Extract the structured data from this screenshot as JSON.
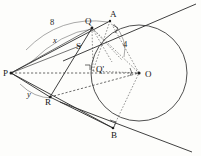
{
  "figure": {
    "background_color": "#fdfdfb",
    "ink_color": "#2b2b2b",
    "arc_color": "#6f6f6f"
  },
  "points": [
    {
      "id": "P",
      "label": "P",
      "x": 11,
      "y": 73,
      "label_x": 3,
      "label_y": 76,
      "dot": true
    },
    {
      "id": "Q",
      "label": "Q",
      "x": 92,
      "y": 28,
      "label_x": 85,
      "label_y": 24,
      "dot": true
    },
    {
      "id": "A",
      "label": "A",
      "x": 110,
      "y": 21,
      "label_x": 110,
      "label_y": 17,
      "dot": true
    },
    {
      "id": "S",
      "label": "S",
      "x": 82,
      "y": 45,
      "label_x": 76,
      "label_y": 49,
      "dot": false
    },
    {
      "id": "Qp",
      "label": "Q'",
      "x": 93,
      "y": 71,
      "label_x": 96,
      "label_y": 72,
      "dot": false
    },
    {
      "id": "O",
      "label": "O",
      "x": 139,
      "y": 73,
      "label_x": 145,
      "label_y": 77,
      "dot": true
    },
    {
      "id": "R",
      "label": "R",
      "x": 50,
      "y": 97,
      "label_x": 45,
      "label_y": 105,
      "dot": true
    },
    {
      "id": "B",
      "label": "B",
      "x": 113,
      "y": 128,
      "label_x": 111,
      "label_y": 138,
      "dot": true
    }
  ],
  "measure_labels": [
    {
      "id": "len-8",
      "text": "8",
      "x": 50,
      "y": 25,
      "style": "num"
    },
    {
      "id": "len-x",
      "text": "x",
      "x": 53,
      "y": 43,
      "style": "len"
    },
    {
      "id": "len-4",
      "text": "4",
      "x": 123,
      "y": 47,
      "style": "num"
    },
    {
      "id": "len-y",
      "text": "y",
      "x": 27,
      "y": 97,
      "style": "len"
    }
  ],
  "circle": {
    "center_x": 139,
    "center_y": 73,
    "radius": 48
  },
  "segments": [
    {
      "id": "P-A",
      "x1": 11,
      "y1": 73,
      "x2": 110,
      "y2": 21,
      "kind": "solid"
    },
    {
      "id": "P-Q",
      "x1": 11,
      "y1": 73,
      "x2": 92,
      "y2": 28,
      "kind": "thin"
    },
    {
      "id": "P-S",
      "x1": 11,
      "y1": 73,
      "x2": 82,
      "y2": 45,
      "kind": "thin"
    },
    {
      "id": "P-R",
      "x1": 11,
      "y1": 73,
      "x2": 50,
      "y2": 97,
      "kind": "solid"
    },
    {
      "id": "P-B",
      "x1": 11,
      "y1": 73,
      "x2": 113,
      "y2": 128,
      "kind": "solid"
    },
    {
      "id": "Q-R",
      "x1": 92,
      "y1": 28,
      "x2": 50,
      "y2": 97,
      "kind": "solid"
    },
    {
      "id": "R-B",
      "x1": 50,
      "y1": 97,
      "x2": 113,
      "y2": 128,
      "kind": "solid"
    },
    {
      "id": "P-O",
      "x1": 11,
      "y1": 73,
      "x2": 139,
      "y2": 73,
      "kind": "dashed"
    },
    {
      "id": "R-O",
      "x1": 50,
      "y1": 97,
      "x2": 139,
      "y2": 73,
      "kind": "dashed"
    },
    {
      "id": "A-O",
      "x1": 110,
      "y1": 21,
      "x2": 139,
      "y2": 73,
      "kind": "dashed-fine"
    },
    {
      "id": "B-O",
      "x1": 113,
      "y1": 128,
      "x2": 139,
      "y2": 73,
      "kind": "dashed-fine"
    },
    {
      "id": "Q-O",
      "x1": 92,
      "y1": 28,
      "x2": 139,
      "y2": 73,
      "kind": "dashed-fine"
    },
    {
      "id": "Q-Qp",
      "x1": 92,
      "y1": 28,
      "x2": 93,
      "y2": 71,
      "kind": "dashed-fine"
    },
    {
      "id": "Qp-O",
      "x1": 93,
      "y1": 71,
      "x2": 139,
      "y2": 73,
      "kind": "dashed-fine"
    },
    {
      "id": "Q-mid1",
      "x1": 92,
      "y1": 28,
      "x2": 122,
      "y2": 60,
      "kind": "dashed-fine"
    },
    {
      "id": "Q-mid2",
      "x1": 92,
      "y1": 28,
      "x2": 112,
      "y2": 62,
      "kind": "dashed-fine"
    },
    {
      "id": "A-Qp",
      "x1": 110,
      "y1": 21,
      "x2": 93,
      "y2": 71,
      "kind": "dashed-fine"
    }
  ],
  "tangent_lines": [
    {
      "id": "tangent-upper",
      "x1": 63,
      "y1": 61,
      "x2": 196,
      "y2": 4,
      "kind": "solid"
    },
    {
      "id": "tangent-lower",
      "x1": 60,
      "y1": 102,
      "x2": 192,
      "y2": 152,
      "kind": "solid"
    }
  ],
  "arcs": [
    {
      "id": "arc-8",
      "d": "M 26 50 Q 60 15 108 22",
      "label": "8"
    },
    {
      "id": "arc-x",
      "d": "M 30 63 Q 62 32 92 29",
      "label": "x"
    },
    {
      "id": "arc-4",
      "d": "M 114 24 Q 128 40 124 57",
      "label": "4"
    },
    {
      "id": "arc-y",
      "d": "M 20 84 Q 34 98 52 98",
      "label": "y"
    }
  ],
  "right_angle_marks": [
    {
      "id": "right-angle-A",
      "d": "M 113 25 L 118 28 L 115 33"
    },
    {
      "id": "right-angle-Qp",
      "d": "M 85 65 L 90 65 L 90 70"
    },
    {
      "id": "right-angle-B",
      "d": "M 110 120 L 116 122 L 114 127"
    }
  ],
  "angle_arcs": [
    {
      "id": "angle-at-O",
      "d": "M 130 68 Q 133 72 130 76"
    }
  ]
}
